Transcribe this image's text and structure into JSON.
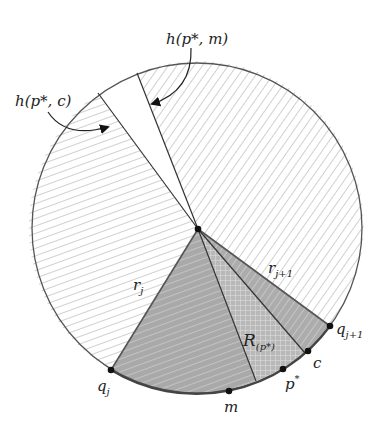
{
  "diagram": {
    "title": "",
    "circle": {
      "cx": 197,
      "cy": 228,
      "r": 165
    },
    "center": {
      "x": 198,
      "y": 229
    },
    "colors": {
      "outline": "#555555",
      "line": "#333333",
      "hatch": "#c8c8c8",
      "shaded": "#b4b4b4",
      "shaded_light": "#cacaca",
      "point": "#111111"
    },
    "points": {
      "q_j": {
        "x": 111,
        "y": 370,
        "label": "q_j"
      },
      "m": {
        "x": 229,
        "y": 391,
        "label": "m"
      },
      "p_star": {
        "x": 283,
        "y": 369,
        "label": "p*"
      },
      "c": {
        "x": 308,
        "y": 351,
        "label": "c"
      },
      "q_j1": {
        "x": 330,
        "y": 326,
        "label": "q_{j+1}"
      }
    },
    "labels": {
      "h_c": "h(p*, c)",
      "h_m": "h(p*, m)",
      "r_j": "r",
      "r_j_sub": "j",
      "r_j1": "r",
      "r_j1_sub": "j+1",
      "R": "R",
      "R_sub": "(p*)",
      "q_j": "q",
      "q_j_sub": "j",
      "q_j1": "q",
      "q_j1_sub": "j+1",
      "m": "m",
      "p_star": "p",
      "p_star_sup": "*",
      "c": "c"
    }
  }
}
